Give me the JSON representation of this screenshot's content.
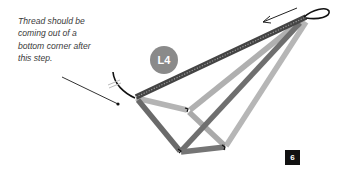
{
  "caption": {
    "text": "Thread should be\ncoming out of a\nbottom corner after\nthis step."
  },
  "badges": {
    "label": "L4",
    "step": "6"
  },
  "colors": {
    "badge_bg": "#8a8a8a",
    "step_bg": "#111111",
    "bead_dark": "#5f5f5f",
    "bead_mid": "#7d7d7d",
    "bead_light": "#b0b0b0",
    "thread": "#111111"
  },
  "icons": {
    "direction_arrow": "arrow-left-icon"
  }
}
